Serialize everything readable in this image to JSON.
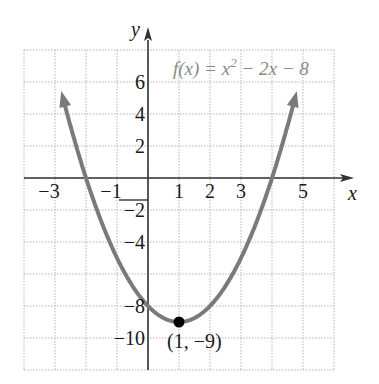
{
  "chart_data": {
    "type": "line",
    "function_label": {
      "prefix": "f(x) = x",
      "exp": "2",
      "suffix": " − 2x − 8"
    },
    "xlabel": "x",
    "ylabel": "y",
    "xlim": [
      -4,
      6
    ],
    "ylim": [
      -12,
      8
    ],
    "grid": true,
    "grid_style": "dotted",
    "x_ticks": [
      {
        "value": -3,
        "label": "−3"
      },
      {
        "value": -1,
        "label": "−1"
      },
      {
        "value": 1,
        "label": "1"
      },
      {
        "value": 2,
        "label": "2"
      },
      {
        "value": 3,
        "label": "3"
      },
      {
        "value": 5,
        "label": "5"
      }
    ],
    "y_ticks": [
      {
        "value": 6,
        "label": "6"
      },
      {
        "value": 4,
        "label": "4"
      },
      {
        "value": 2,
        "label": "2"
      },
      {
        "value": -2,
        "label": "−2"
      },
      {
        "value": -4,
        "label": "−4"
      },
      {
        "value": -8,
        "label": "−8"
      },
      {
        "value": -10,
        "label": "−10"
      }
    ],
    "series": [
      {
        "name": "f(x) = x^2 - 2x - 8",
        "x": [
          -2.8,
          -2,
          -1,
          0,
          1,
          2,
          3,
          4,
          4.8
        ],
        "y": [
          5.44,
          0,
          -5,
          -8,
          -9,
          -8,
          -5,
          0,
          5.44
        ],
        "color": "#7a7a7a",
        "arrows_both_ends": true
      }
    ],
    "annotations": [
      {
        "type": "point",
        "x": 1,
        "y": -9,
        "label": "(1, −9)",
        "color": "#000000"
      }
    ]
  },
  "colors": {
    "curve": "#7a7a7a",
    "axis": "#333333",
    "grid": "#b5b5b5",
    "vertex": "#000000"
  }
}
